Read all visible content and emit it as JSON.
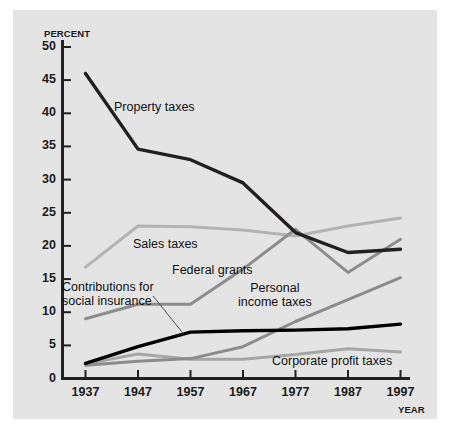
{
  "axes": {
    "y_axis_title": "PERCENT",
    "x_axis_title": "YEAR",
    "y_ticks": [
      "50",
      "45",
      "40",
      "35",
      "30",
      "25",
      "20",
      "15",
      "10",
      "5",
      "0"
    ],
    "x_ticks": [
      "1937",
      "1947",
      "1957",
      "1967",
      "1977",
      "1987",
      "1997"
    ]
  },
  "series_labels": {
    "property": "Property taxes",
    "sales": "Sales taxes",
    "federal": "Federal grants",
    "contributions": "Contributions for\nsocial insurance",
    "personal": "Personal\nincome taxes",
    "corporate": "Corporate profit taxes"
  },
  "colors": {
    "property": "#231f20",
    "sales": "#b3b3b3",
    "federal": "#8c8c8c",
    "contributions": "#000000",
    "personal": "#8c8c8c",
    "corporate": "#a6a6a6",
    "axis": "#231f20",
    "panel_background": "#e4e4e4",
    "page_background": "#ffffff"
  },
  "chart_data": {
    "type": "line",
    "title": "",
    "xlabel": "YEAR",
    "ylabel": "PERCENT",
    "xlim": [
      1937,
      1997
    ],
    "ylim": [
      0,
      52
    ],
    "ytick_values": [
      0,
      5,
      10,
      15,
      20,
      25,
      30,
      35,
      40,
      45,
      50
    ],
    "grid": false,
    "legend": "inline-annotations",
    "x": [
      1937,
      1947,
      1957,
      1967,
      1977,
      1987,
      1997
    ],
    "series": [
      {
        "name": "Property taxes",
        "values": [
          46.0,
          34.6,
          33.0,
          29.5,
          22.0,
          19.0,
          19.5
        ]
      },
      {
        "name": "Sales taxes",
        "values": [
          16.8,
          23.0,
          22.9,
          22.4,
          21.5,
          23.0,
          24.2
        ]
      },
      {
        "name": "Federal grants",
        "values": [
          9.0,
          11.2,
          11.2,
          16.5,
          22.5,
          16.0,
          21.0
        ]
      },
      {
        "name": "Contributions for social insurance",
        "values": [
          2.3,
          4.8,
          7.0,
          7.2,
          7.3,
          7.5,
          8.2
        ]
      },
      {
        "name": "Personal income taxes",
        "values": [
          2.0,
          2.6,
          3.0,
          4.8,
          8.6,
          11.9,
          15.2
        ]
      },
      {
        "name": "Corporate profit taxes",
        "values": [
          2.2,
          3.7,
          2.9,
          2.9,
          3.6,
          4.5,
          4.0
        ]
      }
    ]
  }
}
